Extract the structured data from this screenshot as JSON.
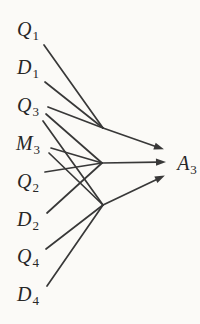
{
  "diagram": {
    "type": "fan-in-arrow-diagram",
    "background_color": "#fbfaf7",
    "stroke_color": "#383838",
    "text_color": "#272727",
    "stroke_width": 1.7,
    "labels": [
      {
        "id": "Q1",
        "main": "Q",
        "sub": "1",
        "cx": 28,
        "cy": 29
      },
      {
        "id": "D1",
        "main": "D",
        "sub": "1",
        "cx": 28,
        "cy": 67
      },
      {
        "id": "Q3",
        "main": "Q",
        "sub": "3",
        "cx": 28,
        "cy": 105
      },
      {
        "id": "M3",
        "main": "M",
        "sub": "3",
        "cx": 28,
        "cy": 143
      },
      {
        "id": "Q2",
        "main": "Q",
        "sub": "2",
        "cx": 28,
        "cy": 181
      },
      {
        "id": "D2",
        "main": "D",
        "sub": "2",
        "cx": 28,
        "cy": 219
      },
      {
        "id": "Q4",
        "main": "Q",
        "sub": "4",
        "cx": 28,
        "cy": 256
      },
      {
        "id": "D4",
        "main": "D",
        "sub": "4",
        "cx": 28,
        "cy": 294
      }
    ],
    "answer": {
      "id": "A3",
      "main": "A",
      "sub": "3",
      "cx": 187,
      "cy": 163
    },
    "hubs": [
      {
        "id": "hub-top",
        "x": 103,
        "y": 128
      },
      {
        "id": "hub-middle",
        "x": 102,
        "y": 163
      },
      {
        "id": "hub-bottom",
        "x": 103,
        "y": 205
      }
    ],
    "lines": [
      {
        "source": "Q1",
        "hub": "hub-top",
        "from": [
          44,
          45
        ],
        "to": [
          103,
          128
        ]
      },
      {
        "source": "D1",
        "hub": "hub-top",
        "from": [
          45,
          82
        ],
        "to": [
          103,
          128
        ]
      },
      {
        "source": "Q3",
        "hub": "hub-top",
        "from": [
          48,
          107
        ],
        "to": [
          103,
          128
        ]
      },
      {
        "source": "Q3",
        "hub": "hub-middle",
        "from": [
          46,
          114
        ],
        "to": [
          102,
          163
        ]
      },
      {
        "source": "Q3",
        "hub": "hub-bottom",
        "from": [
          43,
          121
        ],
        "to": [
          103,
          205
        ]
      },
      {
        "source": "M3",
        "hub": "hub-middle",
        "from": [
          51,
          148
        ],
        "to": [
          102,
          163
        ]
      },
      {
        "source": "M3",
        "hub": "hub-bottom",
        "from": [
          49,
          153
        ],
        "to": [
          103,
          205
        ]
      },
      {
        "source": "Q2",
        "hub": "hub-middle",
        "from": [
          45,
          172
        ],
        "to": [
          102,
          163
        ]
      },
      {
        "source": "D2",
        "hub": "hub-middle",
        "from": [
          47,
          213
        ],
        "to": [
          102,
          163
        ]
      },
      {
        "source": "Q4",
        "hub": "hub-bottom",
        "from": [
          46,
          249
        ],
        "to": [
          103,
          205
        ]
      },
      {
        "source": "D4",
        "hub": "hub-bottom",
        "from": [
          47,
          286
        ],
        "to": [
          103,
          205
        ]
      }
    ],
    "arrows": [
      {
        "hub": "hub-top",
        "target": "A3",
        "from": [
          103,
          128
        ],
        "to": [
          163,
          149
        ]
      },
      {
        "hub": "hub-middle",
        "target": "A3",
        "from": [
          102,
          163
        ],
        "to": [
          165,
          162
        ]
      },
      {
        "hub": "hub-bottom",
        "target": "A3",
        "from": [
          103,
          205
        ],
        "to": [
          164,
          176
        ]
      }
    ],
    "arrowhead": {
      "length": 9,
      "half_width": 3.6
    }
  }
}
